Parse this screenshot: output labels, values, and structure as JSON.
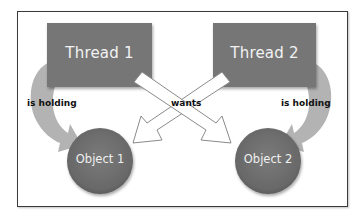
{
  "diagram": {
    "nodes": {
      "thread1": {
        "label": "Thread 1",
        "shape": "rectangle"
      },
      "thread2": {
        "label": "Thread 2",
        "shape": "rectangle"
      },
      "object1": {
        "label": "Object 1",
        "shape": "circle"
      },
      "object2": {
        "label": "Object 2",
        "shape": "circle"
      }
    },
    "edges": {
      "t1_holds": {
        "from": "Thread 1",
        "to": "Object 1",
        "label": "is holding"
      },
      "t2_holds": {
        "from": "Thread 2",
        "to": "Object 2",
        "label": "is holding"
      },
      "wants": {
        "label": "wants",
        "pairs": [
          "Thread 1 -> Object 2",
          "Thread 2 -> Object 1"
        ]
      }
    },
    "colors": {
      "box_fill": "#767676",
      "circle_fill": "#6f6f6f",
      "holding_arrow": "#b3b3b3",
      "wants_arrow_fill": "#ffffff",
      "wants_arrow_stroke": "#8a8a8a",
      "frame_border": "#3a3a3a"
    }
  }
}
